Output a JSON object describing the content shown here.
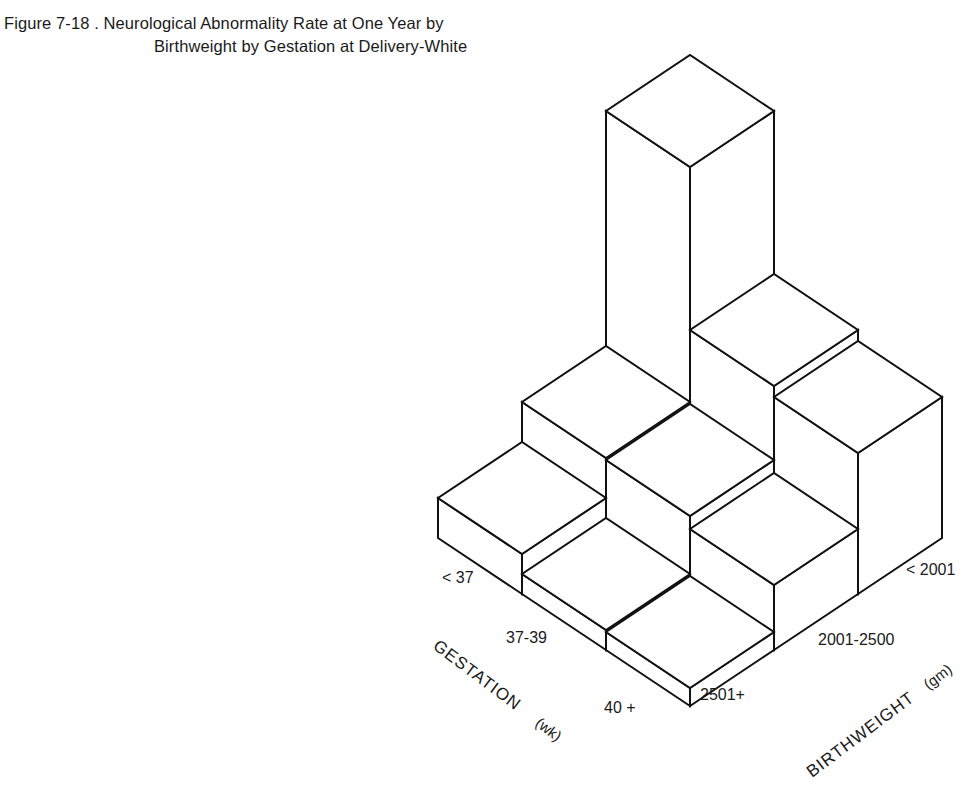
{
  "title": {
    "line1": "Figure 7-18 . Neurological Abnormality Rate at One Year by",
    "line2": "Birthweight by Gestation at Delivery-White"
  },
  "axes": {
    "gestation": {
      "label": "GESTATION",
      "unit": "(wk)",
      "ticks": [
        "< 37",
        "37-39",
        "40 +"
      ]
    },
    "birthweight": {
      "label": "BIRTHWEIGHT",
      "unit": "(gm)",
      "ticks": [
        "< 2001",
        "2001-2500",
        "2501+"
      ]
    }
  },
  "colors": {
    "face": "#ffffff",
    "stroke": "#111111",
    "text": "#1a1a1a"
  },
  "projection": {
    "origin": [
      690,
      706
    ],
    "bw_step": [
      84,
      -56
    ],
    "gest_step": [
      -84,
      -56
    ]
  },
  "chart_data": {
    "type": "bar3d",
    "title": "Neurological Abnormality Rate at One Year by Birthweight by Gestation at Delivery-White",
    "xlabel": "GESTATION (wk)",
    "ylabel": "BIRTHWEIGHT (gm)",
    "zlabel": "Neurological abnormality rate (relative bar height, no scale shown)",
    "gestation_categories": [
      "40 +",
      "37-39",
      "< 37"
    ],
    "birthweight_categories": [
      "2501+",
      "2001-2500",
      "< 2001"
    ],
    "values_note": "Relative heights in pixels (no numeric axis shown); rows = gestation, columns = birthweight",
    "values": [
      [
        18,
        65,
        141
      ],
      [
        20,
        78,
        152
      ],
      [
        40,
        80,
        315
      ]
    ],
    "grid": false,
    "legend": null
  }
}
